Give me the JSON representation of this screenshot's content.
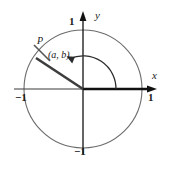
{
  "figure": {
    "kind": "unit-circle-diagram",
    "geometry": {
      "center_x": 83,
      "center_y": 89,
      "radius": 59,
      "terminal_point_x": 42,
      "terminal_point_y": 53,
      "angle_degrees": 150
    },
    "colors": {
      "axis": "#111111",
      "circle": "#6b6b6b",
      "ray": "#3d3d3d",
      "arc": "#2b2b2b",
      "text": "#1a1a1a",
      "background": "#ffffff"
    }
  },
  "axes": {
    "x_label": "x",
    "y_label": "y",
    "x_max_tick": "1",
    "x_min_tick": "−1",
    "y_max_tick": "1",
    "y_min_tick": "−1"
  },
  "point": {
    "name": "P",
    "coordinates": "(a, b)"
  }
}
